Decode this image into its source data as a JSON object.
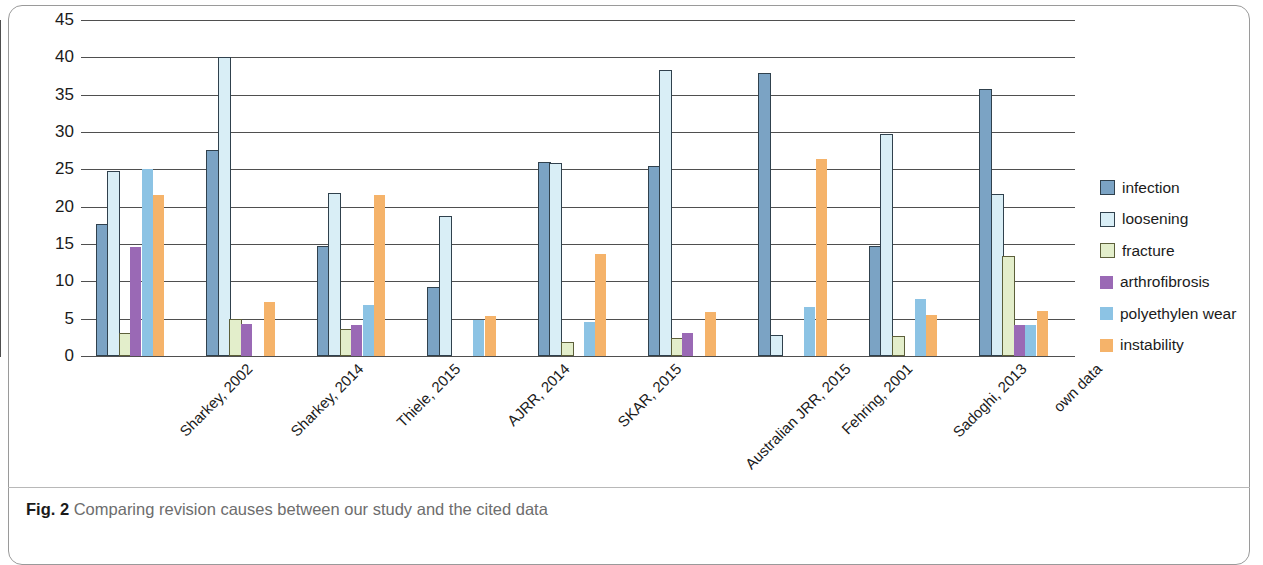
{
  "caption": {
    "prefix": "Fig. 2",
    "text": "Comparing revision causes between our study and the cited data"
  },
  "chart_data": {
    "type": "bar",
    "title": "",
    "xlabel": "",
    "ylabel": "TKA revisions (%)",
    "ylim": [
      0,
      45
    ],
    "yticks": [
      0,
      5,
      10,
      15,
      20,
      25,
      30,
      35,
      40,
      45
    ],
    "grid": true,
    "legend_position": "right",
    "categories": [
      "Sharkey, 2002",
      "Sharkey, 2014",
      "Thiele, 2015",
      "AJRR, 2014",
      "SKAR, 2015",
      "Australian JRR, 2015",
      "Fehring, 2001",
      "Sadoghi, 2013",
      "own data"
    ],
    "series": [
      {
        "name": "infection",
        "color": "#7ba3c4",
        "border": "#30414d",
        "values": [
          17.4,
          27.3,
          14.4,
          9.0,
          25.7,
          25.2,
          37.6,
          14.4,
          35.5
        ]
      },
      {
        "name": "loosening",
        "color": "#d9eef6",
        "border": "#30414d",
        "values": [
          24.5,
          39.8,
          21.6,
          18.5,
          25.6,
          38.0,
          2.6,
          29.4,
          21.4
        ]
      },
      {
        "name": "fracture",
        "color": "#e3eecb",
        "border": "#5c5f3a",
        "values": [
          2.8,
          4.7,
          3.3,
          0,
          1.6,
          2.2,
          0,
          2.4,
          13.1
        ]
      },
      {
        "name": "arthrofibrosis",
        "color": "#9a69b5",
        "border": "",
        "values": [
          14.6,
          4.3,
          4.2,
          0,
          0,
          3.1,
          0,
          0,
          4.1
        ]
      },
      {
        "name": "polyethylen wear",
        "color": "#8cc3e4",
        "border": "",
        "values": [
          25.0,
          0,
          6.8,
          4.8,
          4.6,
          0,
          6.5,
          7.6,
          4.2
        ]
      },
      {
        "name": "instability",
        "color": "#f5b36a",
        "border": "",
        "values": [
          21.5,
          7.2,
          21.5,
          5.4,
          13.6,
          5.9,
          26.4,
          5.5,
          6.0
        ]
      }
    ]
  }
}
